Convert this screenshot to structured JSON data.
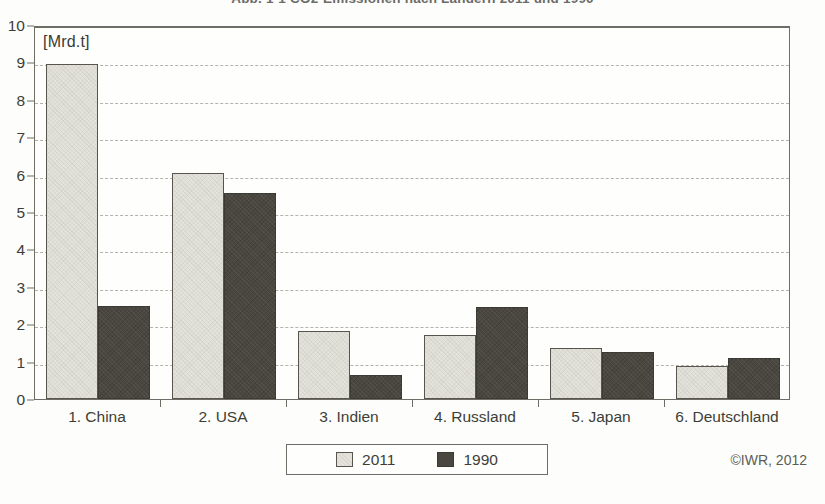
{
  "figure": {
    "title": "Abb. 1-1   CO2-Emissionen nach Ländern 2011 und 1990",
    "credit": "©IWR, 2012",
    "unit_label": "[Mrd.t]"
  },
  "legend": {
    "items": [
      {
        "label": "2011",
        "color": "#e3e3dc"
      },
      {
        "label": "1990",
        "color": "#4a4740"
      }
    ]
  },
  "axis": {
    "y_ticks": [
      "10",
      "9",
      "8",
      "7",
      "6",
      "5",
      "4",
      "3",
      "2",
      "1",
      "0"
    ]
  },
  "chart_data": {
    "type": "bar",
    "title": "Abb. 1-1   CO2-Emissionen nach Ländern 2011 und 1990",
    "xlabel": "",
    "ylabel": "[Mrd.t]",
    "ylim": [
      0,
      10
    ],
    "ytick_step": 1,
    "grid": true,
    "legend_position": "bottom-center",
    "categories": [
      "1. China",
      "2. USA",
      "3. Indien",
      "4. Russland",
      "5. Japan",
      "6. Deutschland"
    ],
    "series": [
      {
        "name": "2011",
        "color": "#e3e3dc",
        "values": [
          8.95,
          6.03,
          1.82,
          1.72,
          1.37,
          0.88
        ]
      },
      {
        "name": "1990",
        "color": "#4a4740",
        "values": [
          2.48,
          5.52,
          0.65,
          2.45,
          1.26,
          1.1
        ]
      }
    ],
    "annotations": [
      "©IWR, 2012"
    ]
  }
}
